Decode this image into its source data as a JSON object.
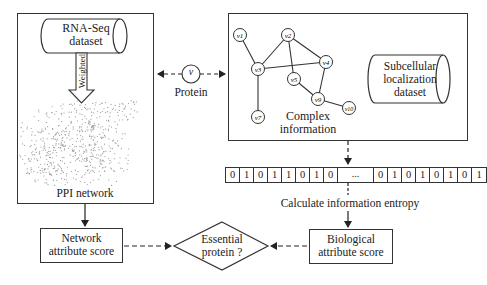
{
  "left_panel": {
    "dataset_label_line1": "RNA-Seq",
    "dataset_label_line2": "dataset",
    "arrow_label": "Weighted",
    "network_label": "PPI network"
  },
  "protein": {
    "node_label": "v",
    "caption": "Protein"
  },
  "right_panel": {
    "complex_label_line1": "Complex",
    "complex_label_line2": "information",
    "dataset_label_line1": "Subcellular",
    "dataset_label_line2": "localization",
    "dataset_label_line3": "dataset",
    "nodes": [
      {
        "id": "v1",
        "x": 240,
        "y": 35
      },
      {
        "id": "v2",
        "x": 288,
        "y": 35
      },
      {
        "id": "v3",
        "x": 258,
        "y": 69
      },
      {
        "id": "v4",
        "x": 326,
        "y": 62
      },
      {
        "id": "v5",
        "x": 294,
        "y": 79
      },
      {
        "id": "v9",
        "x": 318,
        "y": 99
      },
      {
        "id": "v10",
        "x": 349,
        "y": 108
      },
      {
        "id": "v7",
        "x": 258,
        "y": 117
      }
    ],
    "edges": [
      [
        "v1",
        "v3"
      ],
      [
        "v2",
        "v3"
      ],
      [
        "v2",
        "v4"
      ],
      [
        "v2",
        "v5"
      ],
      [
        "v3",
        "v4"
      ],
      [
        "v3",
        "v7"
      ],
      [
        "v5",
        "v9"
      ],
      [
        "v4",
        "v9"
      ],
      [
        "v9",
        "v10"
      ]
    ]
  },
  "bitstrip": {
    "left_bits": [
      "0",
      "1",
      "0",
      "1",
      "1",
      "0",
      "1",
      "0"
    ],
    "ellipsis": "...",
    "right_bits": [
      "0",
      "1",
      "0",
      "1",
      "0",
      "1",
      "0",
      "1"
    ]
  },
  "entropy_label": "Calculate information entropy",
  "network_score": {
    "line1": "Network",
    "line2": "attribute score"
  },
  "biological_score": {
    "line1": "Biological",
    "line2": "attribute score"
  },
  "decision": {
    "line1": "Essential",
    "line2": "protein ?"
  },
  "colors": {
    "stroke": "#333333",
    "ppi_dots": "#9a9a9a"
  }
}
